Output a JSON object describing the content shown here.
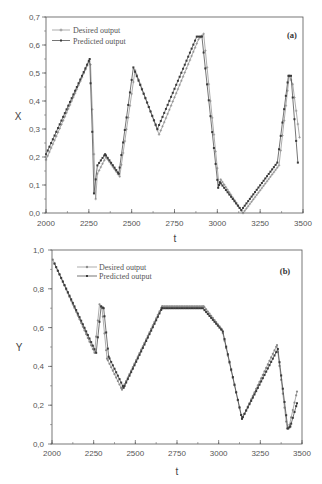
{
  "figure": {
    "panels": [
      {
        "id": "a",
        "panel_label": "(a)",
        "xlabel": "t",
        "ylabel": "X",
        "legend": [
          "Desired output",
          "Predicted output"
        ]
      },
      {
        "id": "b",
        "panel_label": "(b)",
        "xlabel": "t",
        "ylabel": "Y",
        "legend": [
          "Desired output",
          "Predicted output"
        ]
      }
    ],
    "colors": {
      "desired": "#8a8a8a",
      "predicted": "#3a3a3a",
      "axis": "#555555"
    }
  },
  "chart_data": [
    {
      "type": "line",
      "title": "(a)",
      "xlabel": "t",
      "ylabel": "X",
      "xlim": [
        2000,
        3500
      ],
      "ylim": [
        0.0,
        0.7
      ],
      "xticks": [
        2000,
        2250,
        2500,
        2750,
        3000,
        3250,
        3500
      ],
      "xtick_labels": [
        "2000",
        "2250",
        "2500",
        "2750",
        "3000",
        "3250",
        "3500"
      ],
      "yticks": [
        0.0,
        0.1,
        0.2,
        0.3,
        0.4,
        0.5,
        0.6,
        0.7
      ],
      "ytick_labels": [
        "0,0",
        "0,1",
        "0,2",
        "0,3",
        "0,4",
        "0,5",
        "0,6",
        "0,7"
      ],
      "grid": false,
      "legend_position": "upper left",
      "sample_step": 10,
      "series": [
        {
          "name": "Desired output",
          "marker": "cross",
          "points": [
            [
              2000,
              0.19
            ],
            [
              2250,
              0.54
            ],
            [
              2260,
              0.53
            ],
            [
              2290,
              0.05
            ],
            [
              2300,
              0.14
            ],
            [
              2350,
              0.2
            ],
            [
              2430,
              0.13
            ],
            [
              2520,
              0.51
            ],
            [
              2660,
              0.28
            ],
            [
              2890,
              0.62
            ],
            [
              2920,
              0.64
            ],
            [
              3010,
              0.1
            ],
            [
              3020,
              0.12
            ],
            [
              3150,
              0.0
            ],
            [
              3360,
              0.17
            ],
            [
              3420,
              0.49
            ],
            [
              3440,
              0.46
            ],
            [
              3480,
              0.27
            ]
          ]
        },
        {
          "name": "Predicted output",
          "marker": "square",
          "points": [
            [
              2000,
              0.21
            ],
            [
              2255,
              0.55
            ],
            [
              2270,
              0.29
            ],
            [
              2280,
              0.07
            ],
            [
              2300,
              0.17
            ],
            [
              2345,
              0.21
            ],
            [
              2425,
              0.14
            ],
            [
              2510,
              0.52
            ],
            [
              2650,
              0.3
            ],
            [
              2880,
              0.63
            ],
            [
              2910,
              0.63
            ],
            [
              3005,
              0.09
            ],
            [
              3015,
              0.11
            ],
            [
              3140,
              0.01
            ],
            [
              3350,
              0.18
            ],
            [
              3415,
              0.49
            ],
            [
              3430,
              0.49
            ],
            [
              3470,
              0.18
            ]
          ]
        }
      ]
    },
    {
      "type": "line",
      "title": "(b)",
      "xlabel": "t",
      "ylabel": "Y",
      "xlim": [
        2000,
        3500
      ],
      "ylim": [
        0.0,
        1.0
      ],
      "xticks": [
        2000,
        2250,
        2500,
        2750,
        3000,
        3250,
        3500
      ],
      "xtick_labels": [
        "2000",
        "2250",
        "2500",
        "2750",
        "3000",
        "3250",
        "3500"
      ],
      "yticks": [
        0.0,
        0.2,
        0.4,
        0.6,
        0.8,
        1.0
      ],
      "ytick_labels": [
        "0,0",
        "0,2",
        "0,4",
        "0,6",
        "0,8",
        "1,0"
      ],
      "grid": false,
      "legend_position": "upper left",
      "sample_step": 10,
      "series": [
        {
          "name": "Desired output",
          "marker": "cross",
          "points": [
            [
              2005,
              0.95
            ],
            [
              2255,
              0.47
            ],
            [
              2285,
              0.72
            ],
            [
              2300,
              0.7
            ],
            [
              2330,
              0.44
            ],
            [
              2420,
              0.28
            ],
            [
              2660,
              0.71
            ],
            [
              2910,
              0.71
            ],
            [
              3020,
              0.59
            ],
            [
              3140,
              0.13
            ],
            [
              3350,
              0.51
            ],
            [
              3410,
              0.08
            ],
            [
              3420,
              0.08
            ],
            [
              3470,
              0.27
            ]
          ]
        },
        {
          "name": "Predicted output",
          "marker": "square",
          "points": [
            [
              2015,
              0.93
            ],
            [
              2265,
              0.47
            ],
            [
              2295,
              0.71
            ],
            [
              2310,
              0.7
            ],
            [
              2340,
              0.45
            ],
            [
              2430,
              0.29
            ],
            [
              2660,
              0.7
            ],
            [
              2905,
              0.7
            ],
            [
              3025,
              0.58
            ],
            [
              3140,
              0.13
            ],
            [
              3355,
              0.49
            ],
            [
              3415,
              0.08
            ],
            [
              3430,
              0.09
            ],
            [
              3470,
              0.21
            ]
          ]
        }
      ]
    }
  ]
}
